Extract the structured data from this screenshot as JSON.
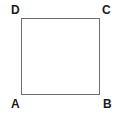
{
  "figure": {
    "name": "square-abcd",
    "shape_type": "square",
    "background_color": "#ffffff",
    "stroke_color": "#6e6e6e",
    "stroke_width_px": 1,
    "fill": "none",
    "geometry": {
      "left_px": 21,
      "top_px": 18,
      "width_px": 79,
      "height_px": 77
    },
    "label_color": "#1a1a1a",
    "vertices": [
      {
        "id": "D",
        "label": "D",
        "position": "top-left"
      },
      {
        "id": "C",
        "label": "C",
        "position": "top-right"
      },
      {
        "id": "A",
        "label": "A",
        "position": "bottom-left"
      },
      {
        "id": "B",
        "label": "B",
        "position": "bottom-right"
      }
    ],
    "sides": [
      {
        "id": "top",
        "from": "D",
        "to": "C"
      },
      {
        "id": "right",
        "from": "C",
        "to": "B"
      },
      {
        "id": "bottom",
        "from": "A",
        "to": "B"
      },
      {
        "id": "left",
        "from": "D",
        "to": "A"
      }
    ]
  }
}
